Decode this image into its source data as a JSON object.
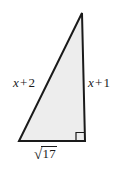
{
  "figure": {
    "type": "right-triangle",
    "background_color": "#ffffff",
    "fill_color": "#ededed",
    "stroke_color": "#1a1a1a",
    "stroke_width": 2,
    "vertices": {
      "apex": [
        82,
        13
      ],
      "bottom_left": [
        19,
        141
      ],
      "bottom_right": [
        85,
        141
      ]
    },
    "right_angle_marker": {
      "at_vertex": "bottom_right",
      "size": 8,
      "x": 76,
      "y": 132
    },
    "labels": {
      "leg_left": {
        "variable": "x",
        "operator": "+",
        "constant": "2",
        "text": "x + 2",
        "side": "hypotenuse"
      },
      "leg_right": {
        "variable": "x",
        "operator": "+",
        "constant": "1",
        "text": "x + 1",
        "side": "vertical-leg"
      },
      "base": {
        "radical_sign": "√",
        "radicand": "17",
        "text": "√17",
        "side": "horizontal-leg"
      }
    }
  }
}
